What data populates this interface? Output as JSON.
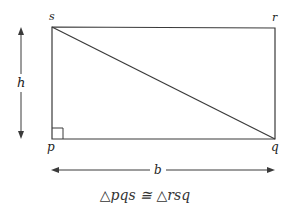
{
  "diagram": {
    "vertices": {
      "s": "s",
      "r": "r",
      "p": "p",
      "q": "q"
    },
    "dimensions": {
      "height_label": "h",
      "base_label": "b"
    },
    "caption": "△pqs ≅ △rsq",
    "colors": {
      "line": "#333333",
      "background": "#ffffff"
    }
  }
}
